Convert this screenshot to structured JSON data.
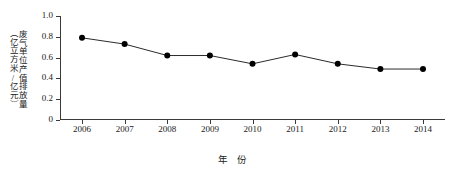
{
  "chart_data": {
    "type": "line",
    "title": "",
    "xlabel": "年 份",
    "ylabel": "废气单位产值排放量（亿立方米/亿元）",
    "ylabel_col1": "废气单位产值排放量",
    "ylabel_col2": "（亿立方米/亿元）",
    "categories": [
      "2006",
      "2007",
      "2008",
      "2009",
      "2010",
      "2011",
      "2012",
      "2013",
      "2014"
    ],
    "values": [
      0.79,
      0.73,
      0.62,
      0.62,
      0.54,
      0.63,
      0.54,
      0.49,
      0.49
    ],
    "series": [
      {
        "name": "废气单位产值排放量",
        "values": [
          0.79,
          0.73,
          0.62,
          0.62,
          0.54,
          0.63,
          0.54,
          0.49,
          0.49
        ]
      }
    ],
    "ylim": [
      0,
      1.0
    ],
    "ytick_labels": [
      "1.0",
      "0.8",
      "0.6",
      "0.4",
      "0.2",
      "0"
    ],
    "ytick_values": [
      1.0,
      0.8,
      0.6,
      0.4,
      0.2,
      0
    ],
    "xtick_labels": [
      "2006",
      "2007",
      "2008",
      "2009",
      "2010",
      "2011",
      "2012",
      "2013",
      "2014"
    ],
    "grid": false,
    "legend": "none",
    "marker": "filled-circle",
    "line_color": "#2b2b2b",
    "marker_color": "#000000",
    "axis_color": "#3a3a3a",
    "background_color": "#ffffff"
  }
}
